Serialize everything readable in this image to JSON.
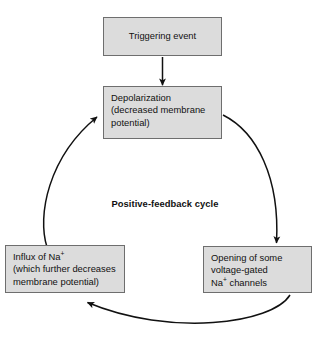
{
  "diagram": {
    "title": "Positive-feedback cycle",
    "center_label": "Positive-feedback cycle",
    "box_fill_color": "#dcdcdc",
    "box_border_color": "#6e6e6e",
    "arrow_color": "#111111",
    "background_color": "#ffffff",
    "nodes": [
      {
        "id": "trigger",
        "lines": [
          "Triggering event"
        ],
        "align": "center"
      },
      {
        "id": "depolarization",
        "lines": [
          "Depolarization",
          "(decreased membrane",
          "potential)"
        ],
        "align": "left"
      },
      {
        "id": "influx",
        "lines": [
          "Influx of Na",
          "(which further decreases",
          "membrane potential)"
        ],
        "superscript": "+",
        "align": "left"
      },
      {
        "id": "channels",
        "lines": [
          "Opening of some",
          "voltage-gated",
          "Na"
        ],
        "superscript": "+",
        "tail": " channels",
        "align": "left"
      }
    ],
    "edges": [
      {
        "id": "trigger-to-depolarization",
        "from": "trigger",
        "to": "depolarization",
        "shape": "straight-down"
      },
      {
        "id": "depolarization-to-channels",
        "from": "depolarization",
        "to": "channels",
        "shape": "curve-right"
      },
      {
        "id": "channels-to-influx",
        "from": "channels",
        "to": "influx",
        "shape": "curve-bottom"
      },
      {
        "id": "influx-to-depolarization",
        "from": "influx",
        "to": "depolarization",
        "shape": "curve-left"
      }
    ]
  }
}
